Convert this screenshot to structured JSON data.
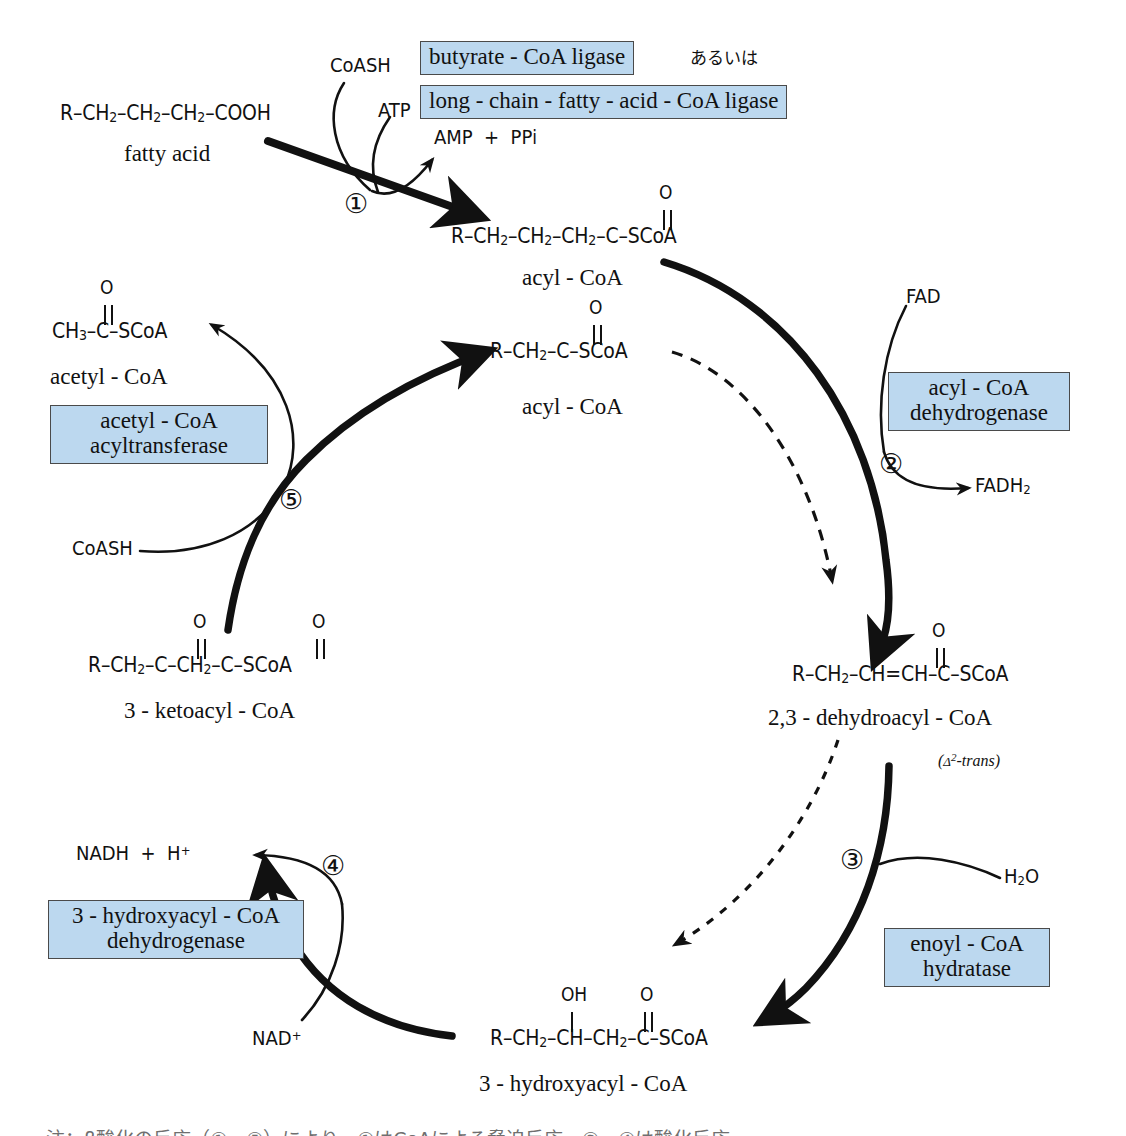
{
  "figure": {
    "kind": "beta-oxidation-cycle-diagram",
    "accent_box_fill": "#bcd8ef",
    "accent_box_border": "#4a4a4a",
    "line_color": "#111111"
  },
  "substrates": {
    "fatty_acid": {
      "formula_parts": [
        "R–CH",
        "2",
        "–CH",
        "2",
        "–CH",
        "2",
        "–COOH"
      ],
      "formula": "R–CH2–CH2–CH2–COOH",
      "name": "fatty acid"
    },
    "acyl_coa_top": {
      "formula": "R–CH2–CH2–CH2–C–SCoA",
      "carbonyl_label": "O",
      "name": "acyl - CoA"
    },
    "acyl_coa_shortened": {
      "formula": "R–CH2–C–SCoA",
      "carbonyl_label": "O",
      "name": "acyl - CoA"
    },
    "acetyl_coa": {
      "formula": "CH3–C–SCoA",
      "carbonyl_label": "O",
      "name": "acetyl - CoA"
    },
    "ketoacyl_coa": {
      "formula": "R–CH2–C–CH2–C–SCoA",
      "carbonyl_label_1": "O",
      "carbonyl_label_2": "O",
      "name": "3 - ketoacyl - CoA"
    },
    "hydroxyacyl_coa": {
      "formula": "R–CH2–CH–CH2–C–SCoA",
      "hydroxyl_label": "OH",
      "carbonyl_label": "O",
      "name": "3 - hydroxyacyl - CoA"
    },
    "dehydroacyl_coa": {
      "formula": "R–CH2–CH=CH–C–SCoA",
      "carbonyl_label": "O",
      "name": "2,3 - dehydroacyl - CoA",
      "isomer_note": "(Δ2-trans)"
    }
  },
  "enzymes": [
    {
      "id": "butyrate-coa-ligase",
      "label": "butyrate - CoA ligase"
    },
    {
      "id": "long-chain-fatty-acid-coa-ligase",
      "label": "long - chain - fatty - acid - CoA ligase"
    },
    {
      "id": "acyl-coa-dehydrogenase",
      "line1": "acyl - CoA",
      "line2": "dehydrogenase"
    },
    {
      "id": "enoyl-coa-hydratase",
      "line1": "enoyl - CoA",
      "line2": "hydratase"
    },
    {
      "id": "hydroxyacyl-coa-dehydrogenase",
      "line1": "3 - hydroxyacyl - CoA",
      "line2": "dehydrogenase"
    },
    {
      "id": "acetyl-coa-acyltransferase",
      "line1": "acetyl - CoA",
      "line2": "acyltransferase"
    }
  ],
  "connector_text": "あるいは",
  "cofactors": {
    "coash_top": "CoASH",
    "atp": "ATP",
    "amp_ppi": "AMP + PPi",
    "fad": "FAD",
    "fadh2": "FADH2",
    "h2o": "H2O",
    "nad_plus": "NAD+",
    "nadh_h": "NADH + H+",
    "coash_left": "CoASH"
  },
  "steps": [
    {
      "n": 1,
      "glyph": "①"
    },
    {
      "n": 2,
      "glyph": "②"
    },
    {
      "n": 3,
      "glyph": "③"
    },
    {
      "n": 4,
      "glyph": "④"
    },
    {
      "n": 5,
      "glyph": "⑤"
    }
  ],
  "caption": {
    "text": "注：β酸化の反応（①～⑤）により、①はCoAによる脅迫反応。②、④は酸化反応。"
  }
}
